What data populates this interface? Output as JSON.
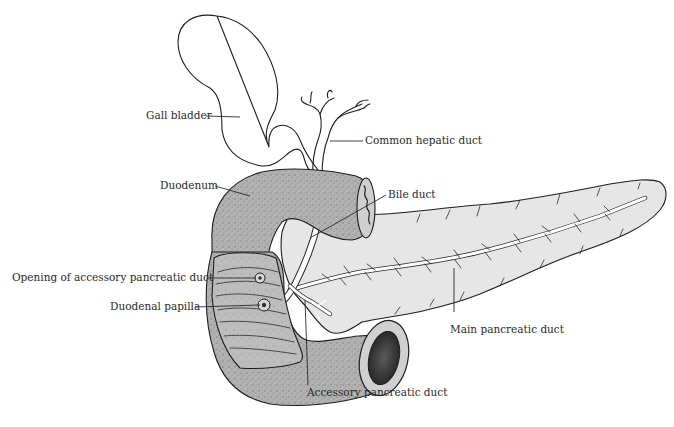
{
  "diagram": {
    "labels": {
      "gall_bladder": "Gall bladder",
      "common_hepatic_duct": "Common hepatic duct",
      "duodenum": "Duodenum",
      "bile_duct": "Bile duct",
      "opening_accessory_duct": "Opening of accessory pancreatic duct",
      "duodenal_papilla": "Duodenal papilla",
      "main_pancreatic_duct": "Main pancreatic duct",
      "accessory_pancreatic_duct": "Accessory pancreatic duct"
    },
    "colors": {
      "background": "#ffffff",
      "pancreas_fill": "#e6e6e6",
      "duodenum_fill": "#a9a9a9",
      "outline": "#1e1e1e",
      "text": "#2a2a2a"
    }
  }
}
